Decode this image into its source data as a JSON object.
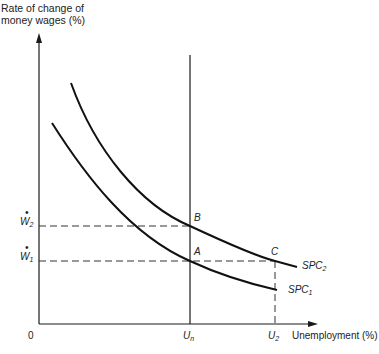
{
  "diagram": {
    "type": "short-run Phillips curve diagram",
    "y_axis_label_line1": "Rate of change of",
    "y_axis_label_line2": "money wages (%)",
    "x_axis_label": "Unemployment (%)",
    "origin_label": "0",
    "x_ticks": [
      {
        "main": "U",
        "sub": "n"
      },
      {
        "main": "U",
        "sub": "2"
      }
    ],
    "y_ticks": [
      {
        "main": "W",
        "sub": "2",
        "dot": "•"
      },
      {
        "main": "W",
        "sub": "1",
        "dot": "•"
      }
    ],
    "points": {
      "A": "A",
      "B": "B",
      "C": "C"
    },
    "curves": [
      {
        "name": "SPC",
        "sub": "1"
      },
      {
        "name": "SPC",
        "sub": "2"
      }
    ],
    "colors": {
      "line": "#1a1a1a",
      "dash": "#333333"
    }
  }
}
